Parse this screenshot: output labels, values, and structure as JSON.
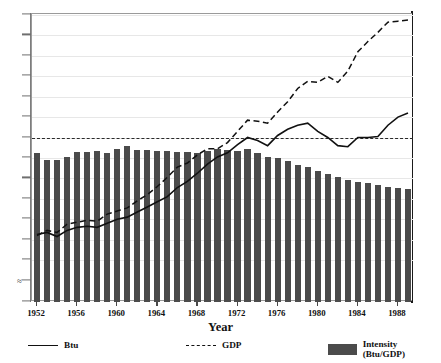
{
  "chart_data": {
    "type": "line",
    "title": "",
    "xlabel": "Year",
    "ylabel": "",
    "ylim": [
      0.0,
      1.6
    ],
    "xlim": [
      1952,
      1989
    ],
    "grid": true,
    "legend_position": "bottom",
    "y_ticks": [
      "0.0",
      "≈",
      "0.4",
      "0.5",
      "0.6",
      "0.7",
      "0.8",
      "0.9",
      "1.0",
      "1.1",
      "1.2",
      "1.3",
      "1.4",
      "1.5",
      "1.6"
    ],
    "y_tick_values": [
      0.0,
      0.2,
      0.4,
      0.5,
      0.6,
      0.7,
      0.8,
      0.9,
      1.0,
      1.1,
      1.2,
      1.3,
      1.4,
      1.5,
      1.6
    ],
    "axis_break": true,
    "reference_line": 1.0,
    "x": [
      1952,
      1953,
      1954,
      1955,
      1956,
      1957,
      1958,
      1959,
      1960,
      1961,
      1962,
      1963,
      1964,
      1965,
      1966,
      1967,
      1968,
      1969,
      1970,
      1971,
      1972,
      1973,
      1974,
      1975,
      1976,
      1977,
      1978,
      1979,
      1980,
      1981,
      1982,
      1983,
      1984,
      1985,
      1986,
      1987,
      1988,
      1989
    ],
    "categories": [
      "1952",
      "1953",
      "1954",
      "1955",
      "1956",
      "1957",
      "1958",
      "1959",
      "1960",
      "1961",
      "1962",
      "1963",
      "1964",
      "1965",
      "1966",
      "1967",
      "1968",
      "1969",
      "1970",
      "1971",
      "1972",
      "1973",
      "1974",
      "1975",
      "1976",
      "1977",
      "1978",
      "1979",
      "1980",
      "1981",
      "1982",
      "1983",
      "1984",
      "1985",
      "1986",
      "1987",
      "1988",
      "1989"
    ],
    "series": [
      {
        "name": "Btu",
        "style": "solid",
        "color": "#111111",
        "values": [
          0.525,
          0.535,
          0.515,
          0.545,
          0.56,
          0.565,
          0.56,
          0.58,
          0.6,
          0.61,
          0.635,
          0.66,
          0.685,
          0.71,
          0.755,
          0.785,
          0.825,
          0.87,
          0.905,
          0.925,
          0.965,
          1.0,
          0.985,
          0.96,
          1.01,
          1.04,
          1.06,
          1.07,
          1.03,
          1.0,
          0.96,
          0.955,
          1.0,
          1.0,
          1.005,
          1.06,
          1.1,
          1.12
        ]
      },
      {
        "name": "GDP",
        "style": "dashed",
        "color": "#111111",
        "values": [
          0.52,
          0.545,
          0.535,
          0.575,
          0.585,
          0.595,
          0.59,
          0.625,
          0.64,
          0.655,
          0.69,
          0.72,
          0.76,
          0.805,
          0.855,
          0.875,
          0.915,
          0.945,
          0.945,
          0.975,
          1.03,
          1.085,
          1.08,
          1.07,
          1.125,
          1.175,
          1.24,
          1.275,
          1.27,
          1.3,
          1.27,
          1.325,
          1.42,
          1.47,
          1.515,
          1.565,
          1.57,
          1.575
        ]
      }
    ],
    "bars": {
      "name": "Intensity (Btu/GDP)",
      "color": "#4b4b4b",
      "values": [
        0.925,
        0.89,
        0.89,
        0.905,
        0.93,
        0.93,
        0.935,
        0.925,
        0.945,
        0.96,
        0.94,
        0.94,
        0.935,
        0.935,
        0.93,
        0.93,
        0.925,
        0.935,
        0.945,
        0.94,
        0.935,
        0.945,
        0.925,
        0.905,
        0.9,
        0.885,
        0.865,
        0.855,
        0.835,
        0.82,
        0.805,
        0.79,
        0.78,
        0.775,
        0.765,
        0.76,
        0.755,
        0.75
      ]
    },
    "x_tick_labels": [
      "1952",
      "1956",
      "1960",
      "1964",
      "1968",
      "1972",
      "1976",
      "1980",
      "1984",
      "1988"
    ],
    "legend": [
      {
        "label": "Btu",
        "marker": "solid-line"
      },
      {
        "label": "GDP",
        "marker": "dashed-line"
      },
      {
        "label": "Intensity (Btu/GDP)",
        "marker": "filled-square"
      }
    ],
    "top_text": ""
  }
}
